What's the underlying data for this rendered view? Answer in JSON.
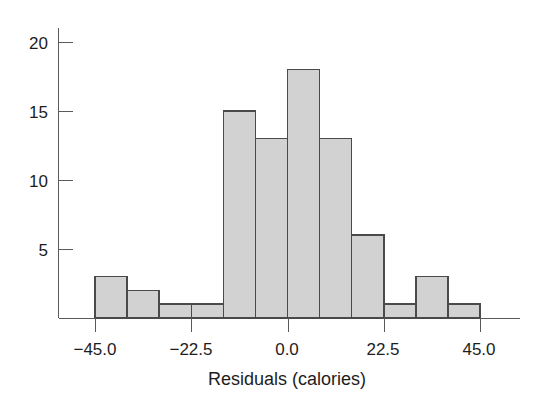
{
  "chart_data": {
    "type": "bar",
    "title": "",
    "subtitle": "",
    "xlabel": "Residuals (calories)",
    "ylabel": "",
    "grid": false,
    "legend": "none",
    "bin_width": 7.5,
    "bin_edges": [
      -45.0,
      -37.5,
      -30.0,
      -22.5,
      -15.0,
      -7.5,
      0.0,
      7.5,
      15.0,
      22.5,
      30.0,
      37.5,
      45.0
    ],
    "categories": [
      "-45.0 to -37.5",
      "-37.5 to -30.0",
      "-30.0 to -22.5",
      "-22.5 to -15.0",
      "-15.0 to -7.5",
      "-7.5 to 0.0",
      "0.0 to 7.5",
      "7.5 to 15.0",
      "15.0 to 22.5",
      "22.5 to 30.0",
      "30.0 to 37.5",
      "37.5 to 45.0"
    ],
    "values": [
      3,
      2,
      1,
      1,
      15,
      13,
      18,
      13,
      6,
      1,
      3,
      1
    ],
    "xlim": [
      -45.0,
      45.0
    ],
    "ylim": [
      0,
      21
    ],
    "xticks": [
      -45.0,
      -22.5,
      0.0,
      22.5,
      45.0
    ],
    "xtick_labels": [
      "−45.0",
      "−22.5",
      "0.0",
      "22.5",
      "45.0"
    ],
    "yticks": [
      5,
      10,
      15,
      20
    ],
    "ytick_labels": [
      "5",
      "10",
      "15",
      "20"
    ],
    "total_count": 77,
    "bar_fill_color": "#d2d2d2",
    "bar_stroke_color": "#4a4a4a",
    "axis_color": "#5a5a5a",
    "text_color": "#1d1d1d",
    "background_color": "#ffffff"
  },
  "axes": {
    "x_axis_title": "Residuals (calories)",
    "y_axis_title": ""
  }
}
